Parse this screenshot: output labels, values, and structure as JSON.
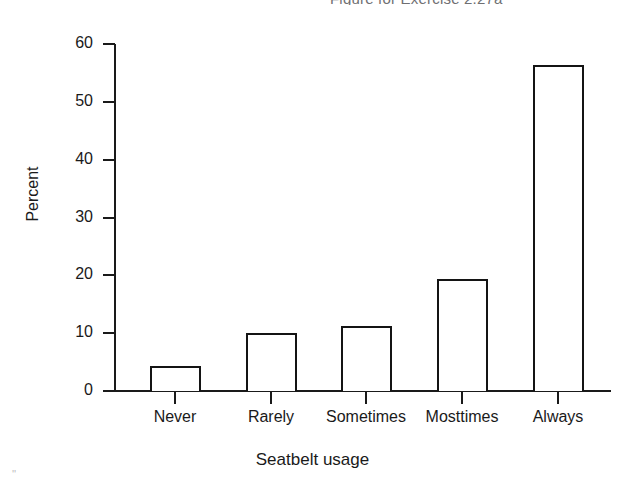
{
  "chart_data": {
    "type": "bar",
    "title": "Figure for Exercise 2.27a",
    "xlabel": "Seatbelt usage",
    "ylabel": "Percent",
    "categories": [
      "Never",
      "Rarely",
      "Sometimes",
      "Mosttimes",
      "Always"
    ],
    "values": [
      4.3,
      10.0,
      11.3,
      19.4,
      56.3
    ],
    "ylim": [
      0,
      60
    ],
    "yticks": [
      0,
      10,
      20,
      30,
      40,
      50,
      60
    ],
    "ytick_labels": [
      "0",
      "10",
      "20",
      "30",
      "40",
      "50",
      "60"
    ],
    "grid": false,
    "legend": false,
    "bar_fill": "#ffffff",
    "bar_edge": "#141414",
    "axis_color": "#1a1a1a",
    "background": "#ffffff"
  },
  "decorative": {
    "speckle": "''"
  }
}
